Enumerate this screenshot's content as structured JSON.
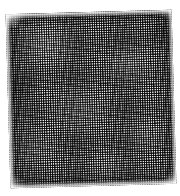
{
  "image": {
    "kind": "texture-photograph",
    "subject": "woven wire mesh screen swatch",
    "width_px": 180,
    "height_px": 196,
    "background_color": "#ffffff",
    "alt_text": "Grayscale close-up photograph of a square swatch of woven wire mesh screen on a white background"
  },
  "swatch": {
    "name": "mesh-swatch",
    "shape": "square",
    "rotation_degrees": -1.6,
    "left_px": 8,
    "top_px": 12,
    "width_px": 166,
    "height_px": 174,
    "weave_period_px": 2.3,
    "strand_color": "#0d0d0d",
    "aperture_color": "#eeeeee",
    "midtone_color": "#787878",
    "edge_shading_color": "#3c3c3c",
    "description": "Plain-weave grid of fine dark strands over bright square apertures, producing a moire mottle"
  },
  "layers": [
    {
      "name": "warp-strands",
      "orientation": "vertical",
      "period_px": 2.3
    },
    {
      "name": "weft-strands",
      "orientation": "horizontal",
      "period_px": 2.3
    },
    {
      "name": "warp-moire",
      "orientation": "vertical",
      "period_px": 2.41
    },
    {
      "name": "weft-moire",
      "orientation": "horizontal",
      "period_px": 2.47
    },
    {
      "name": "lighting-mottle",
      "orientation": "radial"
    },
    {
      "name": "edge-vignette",
      "orientation": "border"
    },
    {
      "name": "frayed-edge-fade",
      "orientation": "border"
    },
    {
      "name": "corner-fade",
      "orientation": "corners"
    }
  ]
}
